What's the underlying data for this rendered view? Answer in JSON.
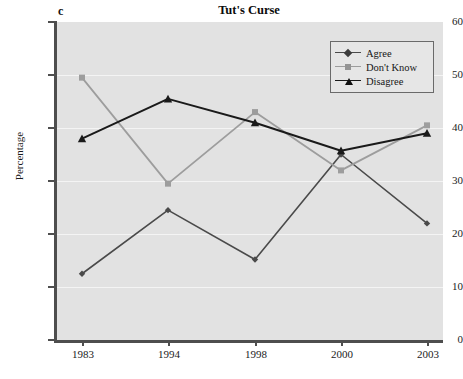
{
  "panel_letter": "c",
  "title": "Tut's Curse",
  "ylabel": "Percentage",
  "legend": {
    "items": [
      {
        "label": "Agree",
        "color": "#4a4a4a",
        "marker": "diamond"
      },
      {
        "label": "Don't Know",
        "color": "#9d9d9d",
        "marker": "square"
      },
      {
        "label": "Disagree",
        "color": "#1a1a1a",
        "marker": "triangle"
      }
    ]
  },
  "axis": {
    "y_ticks": [
      "0",
      "10",
      "20",
      "30",
      "40",
      "50",
      "60"
    ],
    "x_ticks": [
      "1983",
      "1994",
      "1998",
      "2000",
      "2003"
    ]
  },
  "colors": {
    "plot_background": "#e2e2e2",
    "gridline": "#f4f4f4",
    "axis": "#4e4e4e",
    "agree": "#4a4a4a",
    "dont_know": "#9d9d9d",
    "disagree": "#1a1a1a"
  },
  "chart_data": {
    "type": "line",
    "title": "Tut's Curse",
    "panel": "c",
    "xlabel": "",
    "ylabel": "Percentage",
    "categories": [
      "1983",
      "1994",
      "1998",
      "2000",
      "2003"
    ],
    "ylim": [
      0,
      60
    ],
    "yticks": [
      0,
      10,
      20,
      30,
      40,
      50,
      60
    ],
    "grid": true,
    "legend_position": "top-right",
    "series": [
      {
        "name": "Agree",
        "values": [
          12.5,
          24.5,
          15.2,
          35.0,
          22.0
        ]
      },
      {
        "name": "Don't Know",
        "values": [
          49.5,
          29.5,
          43.0,
          32.0,
          40.5
        ]
      },
      {
        "name": "Disagree",
        "values": [
          38.0,
          45.5,
          41.0,
          35.7,
          39.0
        ]
      }
    ]
  }
}
